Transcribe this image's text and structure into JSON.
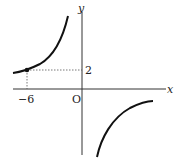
{
  "diagram": {
    "type": "function-graph",
    "function": "y = a/x (hyperbola)",
    "labels": {
      "x_axis": "x",
      "y_axis": "y",
      "origin": "O",
      "x_tick": "−6",
      "y_tick": "2"
    },
    "point": {
      "x": -6,
      "y": 2
    },
    "colors": {
      "curve": "#111111",
      "axis": "#333333",
      "guide": "#555555"
    }
  }
}
